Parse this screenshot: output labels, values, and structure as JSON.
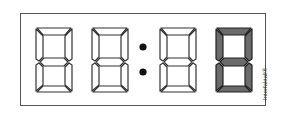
{
  "display": {
    "type": "seven-segment-clock",
    "digits": [
      {
        "position": 1,
        "lit_segments": [],
        "highlighted": false
      },
      {
        "position": 2,
        "lit_segments": [],
        "highlighted": false
      },
      {
        "position": 3,
        "lit_segments": [],
        "highlighted": false
      },
      {
        "position": 4,
        "lit_segments": [
          "a",
          "b",
          "c",
          "d",
          "e",
          "f",
          "g"
        ],
        "highlighted": true,
        "value": "8"
      }
    ],
    "separator": ":",
    "segment_outline_color": "#333333",
    "highlight_fill_color": "#6b6b6b",
    "unlit_fill_color": "#ffffff"
  },
  "brand": {
    "label": "Interfaktall®"
  }
}
